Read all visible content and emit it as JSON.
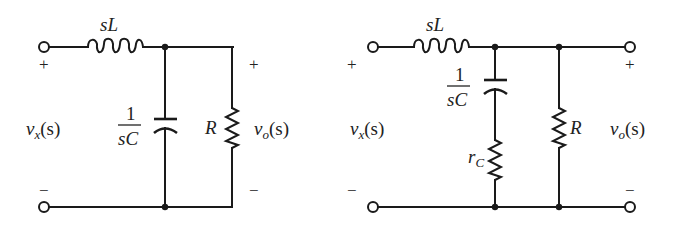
{
  "figure": {
    "colors": {
      "ink": "#1a1a1a",
      "background": "#ffffff"
    }
  },
  "circuit_left": {
    "inductor_label": "sL",
    "capacitor_label_num": "1",
    "capacitor_label_den": "sC",
    "resistor_label": "R",
    "input_label_main": "v",
    "input_label_sub": "x",
    "input_label_arg": "(s)",
    "output_label_main": "v",
    "output_label_sub": "o",
    "output_label_arg": "(s)",
    "input_plus": "+",
    "input_minus": "−",
    "output_plus": "+",
    "output_minus": "−"
  },
  "circuit_right": {
    "inductor_label": "sL",
    "capacitor_label_num": "1",
    "capacitor_label_den": "sC",
    "esr_label_main": "r",
    "esr_label_sub": "C",
    "resistor_label": "R",
    "input_label_main": "v",
    "input_label_sub": "x",
    "input_label_arg": "(s)",
    "output_label_main": "v",
    "output_label_sub": "o",
    "output_label_arg": "(s)",
    "input_plus": "+",
    "input_minus": "−",
    "output_plus": "+",
    "output_minus": "−"
  }
}
